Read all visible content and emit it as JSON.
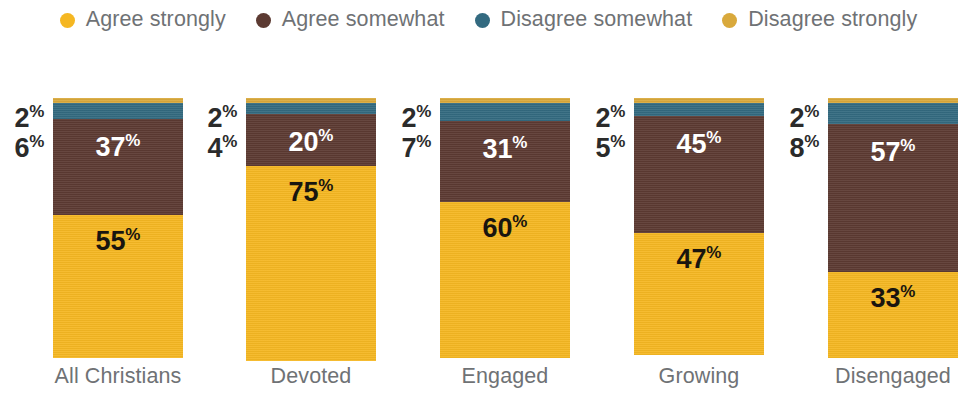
{
  "legend": {
    "items": [
      {
        "label": "Agree strongly",
        "color": "#F5B722",
        "icon": "legend-dot-icon"
      },
      {
        "label": "Agree somewhat",
        "color": "#5C3A32",
        "icon": "legend-dot-icon"
      },
      {
        "label": "Disagree somewhat",
        "color": "#336A80",
        "icon": "legend-dot-icon"
      },
      {
        "label": "Disagree strongly",
        "color": "#D9A93C",
        "icon": "legend-dot-icon"
      }
    ]
  },
  "chart_data": {
    "type": "bar",
    "title": "",
    "subtitle": "",
    "xlabel": "",
    "ylabel": "",
    "ylim": [
      0,
      100
    ],
    "grid": false,
    "stacked": true,
    "stack_order": "bottom-to-top",
    "legend_position": "top-center",
    "value_suffix": "%",
    "categories": [
      "All Christians",
      "Devoted",
      "Engaged",
      "Growing",
      "Disengaged"
    ],
    "series": [
      {
        "name": "Agree strongly",
        "color": "#F5B722",
        "values": [
          55,
          75,
          60,
          47,
          33
        ]
      },
      {
        "name": "Agree somewhat",
        "color": "#5C3A32",
        "values": [
          37,
          20,
          31,
          45,
          57
        ]
      },
      {
        "name": "Disagree somewhat",
        "color": "#336A80",
        "values": [
          6,
          4,
          7,
          5,
          8
        ]
      },
      {
        "name": "Disagree strongly",
        "color": "#D9A93C",
        "values": [
          2,
          2,
          2,
          2,
          2
        ]
      }
    ],
    "annotations": [
      {
        "category": "All Christians",
        "series": "Disagree strongly",
        "text": "2%",
        "placement": "outside-left"
      },
      {
        "category": "All Christians",
        "series": "Disagree somewhat",
        "text": "6%",
        "placement": "outside-left"
      },
      {
        "category": "All Christians",
        "series": "Agree somewhat",
        "text": "37%",
        "placement": "inside"
      },
      {
        "category": "All Christians",
        "series": "Agree strongly",
        "text": "55%",
        "placement": "inside"
      },
      {
        "category": "Devoted",
        "series": "Disagree strongly",
        "text": "2%",
        "placement": "outside-left"
      },
      {
        "category": "Devoted",
        "series": "Disagree somewhat",
        "text": "4%",
        "placement": "outside-left"
      },
      {
        "category": "Devoted",
        "series": "Agree somewhat",
        "text": "20%",
        "placement": "inside"
      },
      {
        "category": "Devoted",
        "series": "Agree strongly",
        "text": "75%",
        "placement": "inside"
      },
      {
        "category": "Engaged",
        "series": "Disagree strongly",
        "text": "2%",
        "placement": "outside-left"
      },
      {
        "category": "Engaged",
        "series": "Disagree somewhat",
        "text": "7%",
        "placement": "outside-left"
      },
      {
        "category": "Engaged",
        "series": "Agree somewhat",
        "text": "31%",
        "placement": "inside"
      },
      {
        "category": "Engaged",
        "series": "Agree strongly",
        "text": "60%",
        "placement": "inside"
      },
      {
        "category": "Growing",
        "series": "Disagree strongly",
        "text": "2%",
        "placement": "outside-left"
      },
      {
        "category": "Growing",
        "series": "Disagree somewhat",
        "text": "5%",
        "placement": "outside-left"
      },
      {
        "category": "Growing",
        "series": "Agree somewhat",
        "text": "45%",
        "placement": "inside"
      },
      {
        "category": "Growing",
        "series": "Agree strongly",
        "text": "47%",
        "placement": "inside"
      },
      {
        "category": "Disengaged",
        "series": "Disagree strongly",
        "text": "2%",
        "placement": "outside-left"
      },
      {
        "category": "Disengaged",
        "series": "Disagree somewhat",
        "text": "8%",
        "placement": "outside-left"
      },
      {
        "category": "Disengaged",
        "series": "Agree somewhat",
        "text": "57%",
        "placement": "inside"
      },
      {
        "category": "Disengaged",
        "series": "Agree strongly",
        "text": "33%",
        "placement": "inside"
      }
    ]
  },
  "bars": [
    {
      "category": "All Christians",
      "outside": [
        {
          "value": "2",
          "pct": "%"
        },
        {
          "value": "6",
          "pct": "%"
        }
      ],
      "segments": [
        {
          "name": "Disagree strongly",
          "value": 2,
          "label": "",
          "pct": "",
          "color": "#D9A93C",
          "label_style": "none"
        },
        {
          "name": "Disagree somewhat",
          "value": 6,
          "label": "",
          "pct": "",
          "color": "#336A80",
          "label_style": "none"
        },
        {
          "name": "Agree somewhat",
          "value": 37,
          "label": "37",
          "pct": "%",
          "color": "#5C3A32",
          "label_style": "on-brown"
        },
        {
          "name": "Agree strongly",
          "value": 55,
          "label": "55",
          "pct": "%",
          "color": "#F5B722",
          "label_style": "on-gold"
        }
      ]
    },
    {
      "category": "Devoted",
      "outside": [
        {
          "value": "2",
          "pct": "%"
        },
        {
          "value": "4",
          "pct": "%"
        }
      ],
      "segments": [
        {
          "name": "Disagree strongly",
          "value": 2,
          "label": "",
          "pct": "",
          "color": "#D9A93C",
          "label_style": "none"
        },
        {
          "name": "Disagree somewhat",
          "value": 4,
          "label": "",
          "pct": "",
          "color": "#336A80",
          "label_style": "none"
        },
        {
          "name": "Agree somewhat",
          "value": 20,
          "label": "20",
          "pct": "%",
          "color": "#5C3A32",
          "label_style": "on-brown"
        },
        {
          "name": "Agree strongly",
          "value": 75,
          "label": "75",
          "pct": "%",
          "color": "#F5B722",
          "label_style": "on-gold"
        }
      ]
    },
    {
      "category": "Engaged",
      "outside": [
        {
          "value": "2",
          "pct": "%"
        },
        {
          "value": "7",
          "pct": "%"
        }
      ],
      "segments": [
        {
          "name": "Disagree strongly",
          "value": 2,
          "label": "",
          "pct": "",
          "color": "#D9A93C",
          "label_style": "none"
        },
        {
          "name": "Disagree somewhat",
          "value": 7,
          "label": "",
          "pct": "",
          "color": "#336A80",
          "label_style": "none"
        },
        {
          "name": "Agree somewhat",
          "value": 31,
          "label": "31",
          "pct": "%",
          "color": "#5C3A32",
          "label_style": "on-brown"
        },
        {
          "name": "Agree strongly",
          "value": 60,
          "label": "60",
          "pct": "%",
          "color": "#F5B722",
          "label_style": "on-gold"
        }
      ]
    },
    {
      "category": "Growing",
      "outside": [
        {
          "value": "2",
          "pct": "%"
        },
        {
          "value": "5",
          "pct": "%"
        }
      ],
      "segments": [
        {
          "name": "Disagree strongly",
          "value": 2,
          "label": "",
          "pct": "",
          "color": "#D9A93C",
          "label_style": "none"
        },
        {
          "name": "Disagree somewhat",
          "value": 5,
          "label": "",
          "pct": "",
          "color": "#336A80",
          "label_style": "none"
        },
        {
          "name": "Agree somewhat",
          "value": 45,
          "label": "45",
          "pct": "%",
          "color": "#5C3A32",
          "label_style": "on-brown"
        },
        {
          "name": "Agree strongly",
          "value": 47,
          "label": "47",
          "pct": "%",
          "color": "#F5B722",
          "label_style": "on-gold"
        }
      ]
    },
    {
      "category": "Disengaged",
      "outside": [
        {
          "value": "2",
          "pct": "%"
        },
        {
          "value": "8",
          "pct": "%"
        }
      ],
      "segments": [
        {
          "name": "Disagree strongly",
          "value": 2,
          "label": "",
          "pct": "",
          "color": "#D9A93C",
          "label_style": "none"
        },
        {
          "name": "Disagree somewhat",
          "value": 8,
          "label": "",
          "pct": "",
          "color": "#336A80",
          "label_style": "none"
        },
        {
          "name": "Agree somewhat",
          "value": 57,
          "label": "57",
          "pct": "%",
          "color": "#5C3A32",
          "label_style": "on-brown"
        },
        {
          "name": "Agree strongly",
          "value": 33,
          "label": "33",
          "pct": "%",
          "color": "#F5B722",
          "label_style": "on-gold"
        }
      ]
    }
  ],
  "layout": {
    "bar_x": [
      53,
      246,
      440,
      634,
      828
    ],
    "bar_width": 130
  }
}
